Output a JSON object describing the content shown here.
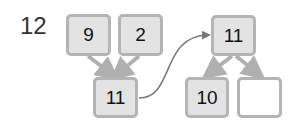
{
  "problem_number": "12",
  "colors": {
    "box_fill": "#e3e3e3",
    "box_border": "#b4b4b4",
    "arrow": "#b0b0b0",
    "curve": "#777777"
  },
  "left_tree": {
    "top_boxes": [
      {
        "value": "9"
      },
      {
        "value": "2"
      }
    ],
    "bottom_box": {
      "value": "11"
    }
  },
  "right_tree": {
    "top_box": {
      "value": "11"
    },
    "bottom_boxes": [
      {
        "value": "10"
      },
      {
        "value": ""
      }
    ]
  }
}
